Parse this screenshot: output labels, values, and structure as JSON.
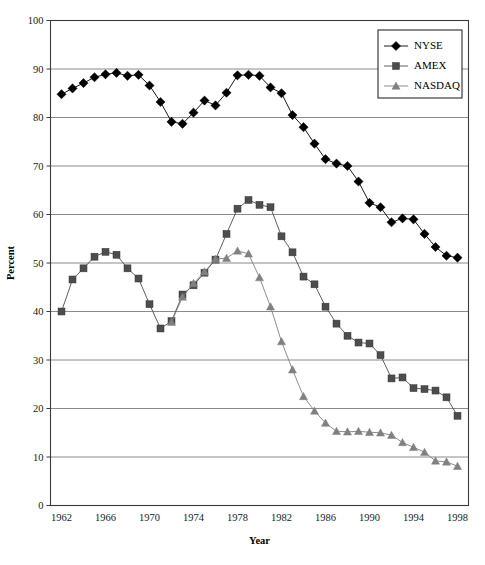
{
  "chart_data": {
    "type": "line",
    "title": "",
    "xlabel": "Year",
    "ylabel": "Percent",
    "xlim": [
      1961,
      1999
    ],
    "ylim": [
      0,
      100
    ],
    "xticks": [
      1962,
      1966,
      1970,
      1974,
      1978,
      1982,
      1986,
      1990,
      1994,
      1998
    ],
    "yticks": [
      0,
      10,
      20,
      30,
      40,
      50,
      60,
      70,
      80,
      90,
      100
    ],
    "grid": "horizontal",
    "legend_position": "top-right",
    "x": [
      1962,
      1963,
      1964,
      1965,
      1966,
      1967,
      1968,
      1969,
      1970,
      1971,
      1972,
      1973,
      1974,
      1975,
      1976,
      1977,
      1978,
      1979,
      1980,
      1981,
      1982,
      1983,
      1984,
      1985,
      1986,
      1987,
      1988,
      1989,
      1990,
      1991,
      1992,
      1993,
      1994,
      1995,
      1996,
      1997,
      1998
    ],
    "series": [
      {
        "name": "NYSE",
        "marker": "diamond",
        "color": "#000000",
        "values": [
          84.8,
          86.0,
          87.1,
          88.3,
          88.9,
          89.2,
          88.6,
          88.8,
          86.6,
          83.2,
          79.1,
          78.7,
          81.0,
          83.5,
          82.5,
          85.1,
          88.7,
          88.8,
          88.6,
          86.2,
          85.0,
          80.5,
          78.0,
          74.6,
          71.4,
          70.5,
          70.0,
          66.8,
          62.4,
          61.5,
          58.4,
          59.2,
          59.0,
          56.0,
          53.3,
          51.5,
          51.1
        ]
      },
      {
        "name": "AMEX",
        "marker": "square",
        "color": "#4d4d4d",
        "values": [
          40.0,
          46.6,
          48.9,
          51.3,
          52.3,
          51.7,
          48.9,
          46.8,
          41.5,
          36.5,
          38.0,
          43.5,
          45.4,
          48.0,
          50.7,
          56.0,
          61.2,
          63.0,
          62.0,
          61.5,
          55.5,
          52.2,
          47.2,
          45.6,
          41.0,
          37.5,
          35.0,
          33.6,
          33.4,
          31.0,
          26.2,
          26.4,
          24.2,
          24.0,
          23.7,
          22.3,
          18.5
        ]
      },
      {
        "name": "NASDAQ",
        "marker": "triangle",
        "color": "#808080",
        "values": [
          null,
          null,
          null,
          null,
          null,
          null,
          null,
          null,
          null,
          null,
          37.8,
          43.0,
          45.8,
          48.2,
          50.8,
          51.0,
          52.5,
          51.9,
          47.0,
          41.0,
          33.8,
          28.0,
          22.5,
          19.5,
          17.0,
          15.3,
          15.2,
          15.3,
          15.1,
          15.0,
          14.5,
          13.0,
          12.0,
          11.0,
          9.2,
          9.0,
          8.1
        ]
      }
    ]
  },
  "legend": {
    "entries": [
      {
        "label": "NYSE"
      },
      {
        "label": "AMEX"
      },
      {
        "label": "NASDAQ"
      }
    ]
  }
}
